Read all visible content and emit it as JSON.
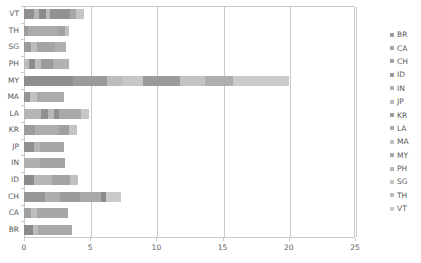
{
  "chart_data": {
    "type": "bar",
    "orientation": "horizontal",
    "stacked": true,
    "title": "",
    "xlabel": "",
    "ylabel": "",
    "xlim": [
      0,
      25
    ],
    "ylim": null,
    "grid": true,
    "xticks": [
      0,
      5,
      10,
      15,
      20,
      25
    ],
    "xtick_labels": [
      "0",
      "5",
      "10",
      "15",
      "20",
      "25"
    ],
    "categories": [
      "VT",
      "TH",
      "SG",
      "PH",
      "MY",
      "MA",
      "LA",
      "KR",
      "JP",
      "IN",
      "ID",
      "CH",
      "CA",
      "BR"
    ],
    "values": [
      4.5,
      3.4,
      3.2,
      3.4,
      20.0,
      3.0,
      4.9,
      4.0,
      3.0,
      3.1,
      4.1,
      7.3,
      3.3,
      3.6
    ],
    "legend_position": "right",
    "legend_entries": [
      "BR",
      "CA",
      "CH",
      "ID",
      "IN",
      "JP",
      "KR",
      "LA",
      "MA",
      "MY",
      "PH",
      "SG",
      "TH",
      "VT"
    ],
    "rows": [
      {
        "label": "VT",
        "total": 4.5,
        "segments": [
          {
            "series": "VT",
            "value": 0.75,
            "color": "#8f8f8f"
          },
          {
            "series": "TH",
            "value": 0.35,
            "color": "#b6b6b6"
          },
          {
            "series": "SG",
            "value": 0.55,
            "color": "#8a8a8a"
          },
          {
            "series": "PH",
            "value": 0.3,
            "color": "#b9b9b9"
          },
          {
            "series": "MY",
            "value": 1.55,
            "color": "#929292"
          },
          {
            "series": "LA",
            "value": 0.45,
            "color": "#a8a8a8"
          },
          {
            "series": "KR",
            "value": 0.55,
            "color": "#c5c5c5"
          }
        ]
      },
      {
        "label": "TH",
        "total": 3.4,
        "segments": [
          {
            "series": "BR",
            "value": 0.3,
            "color": "#9d9d9d"
          },
          {
            "series": "CA",
            "value": 2.3,
            "color": "#ababab"
          },
          {
            "series": "CH",
            "value": 0.5,
            "color": "#a2a2a2"
          },
          {
            "series": "ID",
            "value": 0.3,
            "color": "#c2c2c2"
          }
        ]
      },
      {
        "label": "SG",
        "total": 3.2,
        "segments": [
          {
            "series": "BR",
            "value": 0.55,
            "color": "#9a9a9a"
          },
          {
            "series": "CA",
            "value": 0.45,
            "color": "#bdbdbd"
          },
          {
            "series": "CH",
            "value": 1.35,
            "color": "#a4a4a4"
          },
          {
            "series": "ID",
            "value": 0.85,
            "color": "#b0b0b0"
          }
        ]
      },
      {
        "label": "PH",
        "total": 3.4,
        "segments": [
          {
            "series": "BR",
            "value": 0.4,
            "color": "#bcbcbc"
          },
          {
            "series": "CA",
            "value": 0.45,
            "color": "#8d8d8d"
          },
          {
            "series": "CH",
            "value": 0.45,
            "color": "#bdbdbd"
          },
          {
            "series": "ID",
            "value": 0.9,
            "color": "#9b9b9b"
          },
          {
            "series": "IN",
            "value": 1.2,
            "color": "#b2b2b2"
          }
        ]
      },
      {
        "label": "MY",
        "total": 20.0,
        "segments": [
          {
            "series": "BR",
            "value": 3.7,
            "color": "#8e8e8e"
          },
          {
            "series": "CA",
            "value": 2.6,
            "color": "#9b9b9b"
          },
          {
            "series": "CH",
            "value": 1.1,
            "color": "#bcbcbc"
          },
          {
            "series": "ID",
            "value": 1.6,
            "color": "#c6c6c6"
          },
          {
            "series": "IN",
            "value": 2.8,
            "color": "#9a9a9a"
          },
          {
            "series": "JP",
            "value": 1.9,
            "color": "#c3c3c3"
          },
          {
            "series": "KR",
            "value": 2.1,
            "color": "#aeaeae"
          },
          {
            "series": "LA",
            "value": 4.2,
            "color": "#cbcbcb"
          }
        ]
      },
      {
        "label": "MA",
        "total": 3.0,
        "segments": [
          {
            "series": "BR",
            "value": 0.45,
            "color": "#949494"
          },
          {
            "series": "CA",
            "value": 0.55,
            "color": "#c1c1c1"
          },
          {
            "series": "CH",
            "value": 2.0,
            "color": "#ababab"
          }
        ]
      },
      {
        "label": "LA",
        "total": 4.9,
        "segments": [
          {
            "series": "BR",
            "value": 1.3,
            "color": "#b5b5b5"
          },
          {
            "series": "CA",
            "value": 0.55,
            "color": "#909090"
          },
          {
            "series": "CH",
            "value": 0.4,
            "color": "#b8b8b8"
          },
          {
            "series": "ID",
            "value": 0.4,
            "color": "#8f8f8f"
          },
          {
            "series": "IN",
            "value": 1.65,
            "color": "#a9a9a9"
          },
          {
            "series": "JP",
            "value": 0.6,
            "color": "#c7c7c7"
          }
        ]
      },
      {
        "label": "KR",
        "total": 4.0,
        "segments": [
          {
            "series": "BR",
            "value": 0.85,
            "color": "#9d9d9d"
          },
          {
            "series": "CA",
            "value": 1.8,
            "color": "#adadad"
          },
          {
            "series": "CH",
            "value": 0.75,
            "color": "#a0a0a0"
          },
          {
            "series": "ID",
            "value": 0.6,
            "color": "#c4c4c4"
          }
        ]
      },
      {
        "label": "JP",
        "total": 3.0,
        "segments": [
          {
            "series": "BR",
            "value": 0.75,
            "color": "#8f8f8f"
          },
          {
            "series": "CA",
            "value": 0.45,
            "color": "#b4b4b4"
          },
          {
            "series": "CH",
            "value": 1.8,
            "color": "#a6a6a6"
          }
        ]
      },
      {
        "label": "IN",
        "total": 3.1,
        "segments": [
          {
            "series": "BR",
            "value": 1.2,
            "color": "#b0b0b0"
          },
          {
            "series": "CA",
            "value": 1.9,
            "color": "#a3a3a3"
          }
        ]
      },
      {
        "label": "ID",
        "total": 4.1,
        "segments": [
          {
            "series": "BR",
            "value": 0.75,
            "color": "#8c8c8c"
          },
          {
            "series": "CA",
            "value": 1.4,
            "color": "#b7b7b7"
          },
          {
            "series": "CH",
            "value": 1.35,
            "color": "#a5a5a5"
          },
          {
            "series": "ID",
            "value": 0.6,
            "color": "#c0c0c0"
          }
        ]
      },
      {
        "label": "CH",
        "total": 7.3,
        "segments": [
          {
            "series": "BR",
            "value": 1.6,
            "color": "#969696"
          },
          {
            "series": "CA",
            "value": 1.15,
            "color": "#aeaeae"
          },
          {
            "series": "CH",
            "value": 1.45,
            "color": "#9c9c9c"
          },
          {
            "series": "ID",
            "value": 1.65,
            "color": "#a9a9a9"
          },
          {
            "series": "IN",
            "value": 0.35,
            "color": "#8b8b8b"
          },
          {
            "series": "JP",
            "value": 1.1,
            "color": "#cacaca"
          }
        ]
      },
      {
        "label": "CA",
        "total": 3.3,
        "segments": [
          {
            "series": "BR",
            "value": 0.5,
            "color": "#9f9f9f"
          },
          {
            "series": "CA",
            "value": 0.45,
            "color": "#bebebe"
          },
          {
            "series": "CH",
            "value": 2.35,
            "color": "#a7a7a7"
          }
        ]
      },
      {
        "label": "BR",
        "total": 3.6,
        "segments": [
          {
            "series": "BR",
            "value": 0.7,
            "color": "#8a8a8a"
          },
          {
            "series": "CA",
            "value": 0.35,
            "color": "#bbbbbb"
          },
          {
            "series": "CH",
            "value": 2.55,
            "color": "#a8a8a8"
          }
        ]
      }
    ],
    "legend": [
      {
        "label": "BR",
        "color": "#9d9d9d"
      },
      {
        "label": "CA",
        "color": "#a8a8a8"
      },
      {
        "label": "CH",
        "color": "#a3a3a3"
      },
      {
        "label": "ID",
        "color": "#9a9a9a"
      },
      {
        "label": "IN",
        "color": "#b0b0b0"
      },
      {
        "label": "JP",
        "color": "#bdbdbd"
      },
      {
        "label": "KR",
        "color": "#9f9f9f"
      },
      {
        "label": "LA",
        "color": "#ababab"
      },
      {
        "label": "MA",
        "color": "#c2c2c2"
      },
      {
        "label": "MY",
        "color": "#a6a6a6"
      },
      {
        "label": "PH",
        "color": "#b6b6b6"
      },
      {
        "label": "SG",
        "color": "#c6c6c6"
      },
      {
        "label": "TH",
        "color": "#bcbcbc"
      },
      {
        "label": "VT",
        "color": "#cacaca"
      }
    ]
  }
}
